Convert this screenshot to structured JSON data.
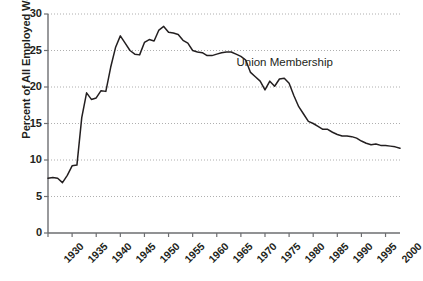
{
  "chart_data": {
    "type": "line",
    "title": "",
    "subtitle": "",
    "xlabel": "",
    "ylabel": "Percent of All Employed Workers",
    "xlim": [
      1930,
      2003
    ],
    "ylim": [
      0,
      30
    ],
    "grid": true,
    "grid_style": "dotted-horizontal",
    "legend": "none",
    "annotations": [
      {
        "text": "Union Membership",
        "x": 1978,
        "y": 23.2
      }
    ],
    "y_ticks": [
      0,
      5,
      10,
      15,
      20,
      25,
      30
    ],
    "y_tick_labels": [
      "0",
      "5",
      "10",
      "15",
      "20",
      "25",
      "30"
    ],
    "x_ticks": [
      1930,
      1935,
      1940,
      1945,
      1950,
      1955,
      1960,
      1965,
      1970,
      1975,
      1980,
      1985,
      1990,
      1995,
      2000
    ],
    "x_tick_labels": [
      "1930",
      "1935",
      "1940",
      "1945",
      "1950",
      "1955",
      "1960",
      "1965",
      "1970",
      "1975",
      "1980",
      "1985",
      "1990",
      "1995",
      "2000"
    ],
    "series": [
      {
        "name": "Union Membership",
        "color": "#231f20",
        "x": [
          1930,
          1931,
          1932,
          1933,
          1934,
          1935,
          1936,
          1937,
          1938,
          1939,
          1940,
          1941,
          1942,
          1943,
          1944,
          1945,
          1946,
          1947,
          1948,
          1949,
          1950,
          1951,
          1952,
          1953,
          1954,
          1955,
          1956,
          1957,
          1958,
          1959,
          1960,
          1961,
          1962,
          1963,
          1964,
          1965,
          1966,
          1967,
          1968,
          1969,
          1970,
          1971,
          1972,
          1973,
          1974,
          1975,
          1976,
          1977,
          1978,
          1979,
          1980,
          1981,
          1982,
          1983,
          1984,
          1985,
          1986,
          1987,
          1988,
          1989,
          1990,
          1991,
          1992,
          1993,
          1994,
          1995,
          1996,
          1997,
          1998,
          1999,
          2000,
          2001,
          2002,
          2003
        ],
        "y": [
          7.5,
          7.6,
          7.5,
          6.9,
          7.9,
          9.2,
          9.3,
          15.8,
          19.2,
          18.3,
          18.5,
          19.5,
          19.4,
          22.7,
          25.4,
          27.0,
          26.0,
          25.0,
          24.5,
          24.4,
          26.1,
          26.5,
          26.3,
          27.8,
          28.3,
          27.5,
          27.4,
          27.2,
          26.4,
          26.0,
          25.0,
          24.8,
          24.7,
          24.3,
          24.3,
          24.5,
          24.7,
          24.8,
          24.8,
          24.5,
          24.2,
          23.7,
          22.0,
          21.4,
          20.8,
          19.6,
          20.8,
          20.1,
          21.1,
          21.2,
          20.5,
          18.8,
          17.3,
          16.3,
          15.3,
          15.0,
          14.6,
          14.2,
          14.2,
          13.8,
          13.5,
          13.3,
          13.3,
          13.2,
          13.0,
          12.6,
          12.3,
          12.1,
          12.2,
          12.0,
          12.0,
          11.9,
          11.8,
          11.6
        ]
      }
    ]
  },
  "axis": {
    "y_title": "Percent of All Employed Workers"
  }
}
